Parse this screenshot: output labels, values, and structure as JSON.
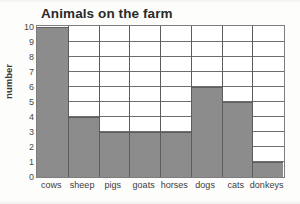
{
  "chart_data": {
    "type": "bar",
    "title": "Animals on the farm",
    "xlabel": "",
    "ylabel": "number",
    "categories": [
      "cows",
      "sheep",
      "pigs",
      "goats",
      "horses",
      "dogs",
      "cats",
      "donkeys"
    ],
    "values": [
      10,
      4,
      3,
      3,
      3,
      6,
      5,
      1
    ],
    "ylim": [
      0,
      10
    ],
    "ytick_labels": [
      "10",
      "9",
      "8",
      "7",
      "6",
      "5",
      "4",
      "3",
      "2",
      "1",
      "0"
    ],
    "ytick_values": [
      10,
      9,
      8,
      7,
      6,
      5,
      4,
      3,
      2,
      1,
      0
    ],
    "grid": "horizontal-and-vertical",
    "legend": "none",
    "bars_touch": true,
    "colors": {
      "bar_fill": "#8c8c8c",
      "bar_edge": "#5e5e5e",
      "gridline": "#6e6e6e",
      "axis_border": "#7d7d7d",
      "plot_background": "#ffffff",
      "page_background": "#fdfdfc",
      "title_text": "#2a2a2a",
      "tick_text": "#3c3c3c"
    }
  }
}
